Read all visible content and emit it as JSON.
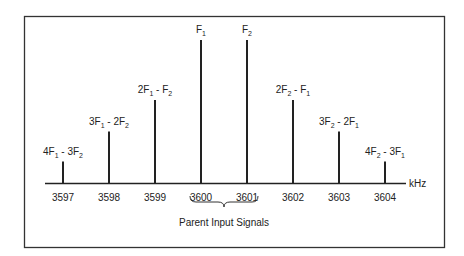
{
  "chart_data": {
    "type": "bar",
    "title": "",
    "xlabel": "",
    "x_unit": "kHz",
    "ylabel": "",
    "xlim": [
      3596.6,
      3604.5
    ],
    "ylim": [
      0,
      1
    ],
    "x_ticks": [
      "3597",
      "3598",
      "3599",
      "3600",
      "3601",
      "3602",
      "3603",
      "3604"
    ],
    "series": [
      {
        "name": "spectral lines",
        "points": [
          {
            "x": 3597,
            "height": 0.15,
            "label": [
              "4F",
              "1",
              " - 3F",
              "2"
            ]
          },
          {
            "x": 3598,
            "height": 0.36,
            "label": [
              "3F",
              "1",
              " - 2F",
              "2"
            ]
          },
          {
            "x": 3599,
            "height": 0.58,
            "label": [
              "2F",
              "1",
              " - F",
              "2"
            ]
          },
          {
            "x": 3600,
            "height": 1.0,
            "label": [
              "F",
              "1",
              "",
              ""
            ]
          },
          {
            "x": 3601,
            "height": 1.0,
            "label": [
              "F",
              "2",
              "",
              ""
            ]
          },
          {
            "x": 3602,
            "height": 0.58,
            "label": [
              "2F",
              "2",
              " - F",
              "1"
            ]
          },
          {
            "x": 3603,
            "height": 0.36,
            "label": [
              "3F",
              "2",
              " - 2F",
              "1"
            ]
          },
          {
            "x": 3604,
            "height": 0.15,
            "label": [
              "4F",
              "2",
              " - 3F",
              "1"
            ]
          }
        ]
      }
    ],
    "annotations": [
      {
        "text": "Parent Input Signals",
        "spans_x": [
          3600,
          3601
        ]
      }
    ]
  }
}
